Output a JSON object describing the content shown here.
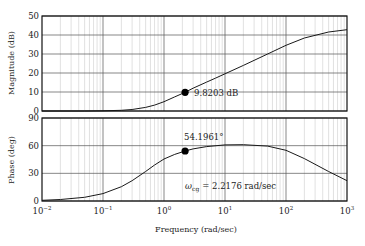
{
  "chart_data": [
    {
      "type": "line",
      "title": "",
      "xscale": "log",
      "xlabel": "Frequency (rad/sec)",
      "ylabel": "Magnitude (dB)",
      "xlim": [
        0.01,
        1000
      ],
      "ylim": [
        0,
        50
      ],
      "yticks": [
        0,
        10,
        20,
        30,
        40,
        50
      ],
      "grid": true,
      "series": [
        {
          "name": "magnitude",
          "x": [
            0.01,
            0.05,
            0.1,
            0.2,
            0.3,
            0.5,
            0.7,
            1,
            1.5,
            2.2176,
            3,
            5,
            7,
            10,
            20,
            50,
            100,
            200,
            500,
            1000
          ],
          "values": [
            0.0,
            0.02,
            0.1,
            0.35,
            0.8,
            1.9,
            3.1,
            4.9,
            7.4,
            9.82,
            12.0,
            15.2,
            17.3,
            19.6,
            24.0,
            30.0,
            34.6,
            38.4,
            41.6,
            42.8
          ]
        }
      ],
      "annotations": [
        {
          "x": 2.2176,
          "y": 9.8203,
          "marker": "dot",
          "text": "9.8203 dB"
        }
      ]
    },
    {
      "type": "line",
      "title": "",
      "xscale": "log",
      "xlabel": "Frequency (rad/sec)",
      "ylabel": "Phase (deg)",
      "xlim": [
        0.01,
        1000
      ],
      "ylim": [
        0,
        90
      ],
      "yticks": [
        0,
        30,
        60,
        90
      ],
      "grid": true,
      "series": [
        {
          "name": "phase",
          "x": [
            0.01,
            0.02,
            0.05,
            0.1,
            0.2,
            0.3,
            0.5,
            0.7,
            1,
            1.5,
            2.2176,
            3,
            5,
            10,
            20,
            50,
            100,
            200,
            500,
            1000
          ],
          "values": [
            0.8,
            1.6,
            4.0,
            8.0,
            15.5,
            22.0,
            32.0,
            39.0,
            45.5,
            50.5,
            54.2,
            56.5,
            59.0,
            60.8,
            61.0,
            59.5,
            55.0,
            46.0,
            32.0,
            22.0
          ]
        }
      ],
      "annotations": [
        {
          "x": 2.2176,
          "y": 54.1961,
          "marker": "dot",
          "text": "54.1961°"
        },
        {
          "x": 2.2176,
          "y": 15,
          "marker": "none",
          "text": "ω_cg = 2.2176 rad/sec"
        }
      ]
    }
  ],
  "labels": {
    "mag_ylabel": "Magnitude (dB)",
    "phase_ylabel": "Phase (deg)",
    "xlabel": "Frequency (rad/sec)",
    "mag_annotation": "9.8203 dB",
    "phase_annotation": "54.1961°",
    "wcg_symbol": "ω",
    "wcg_subscript": "cg",
    "wcg_value": "= 2.2176 rad/sec",
    "mag_yticks": [
      "0",
      "10",
      "20",
      "30",
      "40",
      "50"
    ],
    "phase_yticks": [
      "0",
      "30",
      "60",
      "90"
    ],
    "x_tick_base": "10",
    "x_tick_exps": [
      "−2",
      "−1",
      "0",
      "1",
      "2",
      "3"
    ]
  },
  "colors": {
    "curve": "#1a1a1a",
    "major_grid": "#555555",
    "minor_grid": "#cccccc",
    "frame": "#111111",
    "marker": "#000000"
  }
}
